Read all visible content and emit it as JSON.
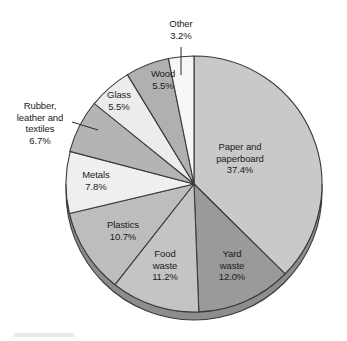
{
  "chart_data": {
    "type": "pie",
    "title": "",
    "subtitle": "",
    "xlabel": "",
    "ylabel": "",
    "legend_position": "none",
    "grid": false,
    "units": "percent",
    "start_angle_deg": 0,
    "direction": "clockwise",
    "categories": [
      "Paper and paperboard",
      "Yard waste",
      "Food waste",
      "Plastics",
      "Metals",
      "Rubber, leather and textiles",
      "Glass",
      "Wood",
      "Other"
    ],
    "values": [
      37.4,
      12.0,
      11.2,
      10.7,
      7.8,
      6.7,
      5.5,
      5.5,
      3.2
    ],
    "slices": [
      {
        "label_lines": [
          "Paper and",
          "paperboard",
          "37.4%"
        ],
        "name": "Paper and paperboard",
        "value": 37.4,
        "value_text": "37.4%",
        "color": "#c9c9c9",
        "label_placement": "inside"
      },
      {
        "label_lines": [
          "Yard",
          "waste",
          "12.0%"
        ],
        "name": "Yard waste",
        "value": 12.0,
        "value_text": "12.0%",
        "color": "#9a9a9a",
        "label_placement": "inside"
      },
      {
        "label_lines": [
          "Food",
          "waste",
          "11.2%"
        ],
        "name": "Food waste",
        "value": 11.2,
        "value_text": "11.2%",
        "color": "#c4c4c4",
        "label_placement": "inside"
      },
      {
        "label_lines": [
          "Plastics",
          "10.7%"
        ],
        "name": "Plastics",
        "value": 10.7,
        "value_text": "10.7%",
        "color": "#bdbdbd",
        "label_placement": "inside"
      },
      {
        "label_lines": [
          "Metals",
          "7.8%"
        ],
        "name": "Metals",
        "value": 7.8,
        "value_text": "7.8%",
        "color": "#efefef",
        "label_placement": "inside"
      },
      {
        "label_lines": [
          "Rubber,",
          "leather and",
          "textiles",
          "6.7%"
        ],
        "name": "Rubber, leather and textiles",
        "value": 6.7,
        "value_text": "6.7%",
        "color": "#b4b4b4",
        "label_placement": "outside-left"
      },
      {
        "label_lines": [
          "Glass",
          "5.5%"
        ],
        "name": "Glass",
        "value": 5.5,
        "value_text": "5.5%",
        "color": "#ececec",
        "label_placement": "inside"
      },
      {
        "label_lines": [
          "Wood",
          "5.5%"
        ],
        "name": "Wood",
        "value": 5.5,
        "value_text": "5.5%",
        "color": "#b0b0b0",
        "label_placement": "inside"
      },
      {
        "label_lines": [
          "Other",
          "3.2%"
        ],
        "name": "Other",
        "value": 3.2,
        "value_text": "3.2%",
        "color": "#f7f7f7",
        "label_placement": "outside-top"
      }
    ]
  },
  "labels": {
    "paper": "Paper and\npaperboard\n37.4%",
    "yard": "Yard\nwaste\n12.0%",
    "food": "Food\nwaste\n11.2%",
    "plastics": "Plastics\n10.7%",
    "metals": "Metals\n7.8%",
    "rubber": "Rubber,\nleather and\ntextiles\n6.7%",
    "glass": "Glass\n5.5%",
    "wood": "Wood\n5.5%",
    "other": "Other\n3.2%"
  },
  "colors": {
    "paper": "#c9c9c9",
    "yard": "#9a9a9a",
    "food": "#c4c4c4",
    "plastics": "#bdbdbd",
    "metals": "#efefef",
    "rubber": "#b4b4b4",
    "glass": "#ececec",
    "wood": "#b0b0b0",
    "other": "#f7f7f7",
    "outline": "#3a3a3a",
    "side_wall": "#8a8a8a",
    "shadow": "#d8d8d8",
    "background": "#ffffff",
    "text": "#1b1b1b"
  }
}
